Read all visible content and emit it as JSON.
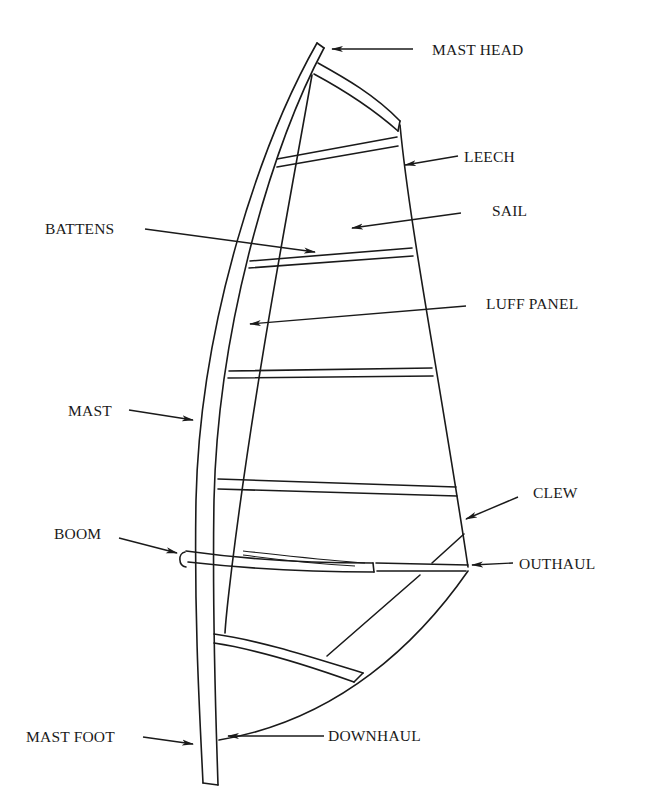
{
  "diagram": {
    "labels": {
      "mast_head": "MAST HEAD",
      "leech": "LEECH",
      "battens": "BATTENS",
      "sail": "SAIL",
      "luff_panel": "LUFF PANEL",
      "mast": "MAST",
      "clew": "CLEW",
      "boom": "BOOM",
      "outhaul": "OUTHAUL",
      "mast_foot": "MAST FOOT",
      "downhaul": "DOWNHAUL"
    },
    "colors": {
      "ink": "#1a1a1a",
      "background": "#ffffff"
    }
  }
}
